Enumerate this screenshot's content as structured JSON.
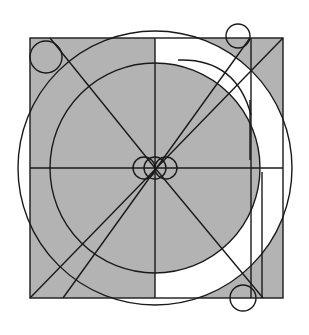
{
  "diagram": {
    "title": "",
    "colors": {
      "background": "#ffffff",
      "shade": "#b3b3b3",
      "stroke": "#1a1a1a"
    },
    "square": {
      "x": 30,
      "y": 38,
      "width": 253,
      "height": 260
    },
    "center": {
      "x": 155,
      "y": 168
    },
    "circles": {
      "outer_radius": 137,
      "inner_radius": 105
    },
    "small_circles": [
      {
        "name": "top-left",
        "cx": 46,
        "cy": 57,
        "r": 16
      },
      {
        "name": "top-right",
        "cx": 238,
        "cy": 36,
        "r": 12
      },
      {
        "name": "bottom-right",
        "cx": 243,
        "cy": 298,
        "r": 13
      },
      {
        "name": "center-left",
        "cx": 144,
        "cy": 168,
        "r": 11
      },
      {
        "name": "center",
        "cx": 155,
        "cy": 168,
        "r": 11
      },
      {
        "name": "center-right",
        "cx": 166,
        "cy": 168,
        "r": 11
      }
    ]
  }
}
